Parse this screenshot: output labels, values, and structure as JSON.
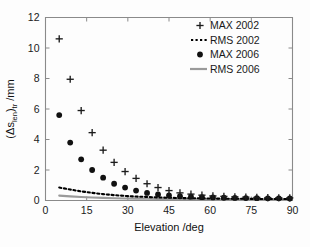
{
  "chart_data": {
    "type": "scatter",
    "title": "",
    "xlabel": "Elevation /deg",
    "ylabel": "(Δs_len)_tr /mm",
    "ylabel_parts": {
      "prefix": "(Δs",
      "sub1": "len",
      "mid": ")",
      "sub2": "tr",
      "suffix": " /mm"
    },
    "xlim": [
      0,
      90
    ],
    "ylim": [
      0,
      12
    ],
    "xticks": [
      0,
      15,
      30,
      45,
      60,
      75,
      90
    ],
    "yticks": [
      0,
      2,
      4,
      6,
      8,
      10,
      12
    ],
    "xtick_labels": [
      "0",
      "15",
      "30",
      "45",
      "60",
      "75",
      "90"
    ],
    "ytick_labels": [
      "0",
      "2",
      "4",
      "6",
      "8",
      "10",
      "12"
    ],
    "grid": false,
    "legend_position": "upper right",
    "x": [
      5,
      9,
      13,
      17,
      21,
      25,
      29,
      33,
      37,
      41,
      45,
      49,
      53,
      57,
      61,
      65,
      69,
      73,
      77,
      81,
      85,
      89
    ],
    "series": [
      {
        "name": "MAX 2002",
        "marker": "plus",
        "color": "#1c1c1c",
        "values": [
          10.6,
          7.95,
          5.9,
          4.45,
          3.3,
          2.5,
          1.9,
          1.45,
          1.1,
          0.85,
          0.65,
          0.5,
          0.42,
          0.35,
          0.3,
          0.27,
          0.24,
          0.22,
          0.2,
          0.19,
          0.18,
          0.17
        ]
      },
      {
        "name": "RMS 2002",
        "marker": "dashed-line",
        "color": "#000000",
        "values": [
          0.85,
          0.72,
          0.6,
          0.5,
          0.42,
          0.35,
          0.3,
          0.26,
          0.23,
          0.2,
          0.18,
          0.16,
          0.15,
          0.14,
          0.13,
          0.12,
          0.11,
          0.11,
          0.1,
          0.1,
          0.1,
          0.1
        ]
      },
      {
        "name": "MAX 2006",
        "marker": "circle",
        "color": "#111111",
        "values": [
          5.6,
          3.8,
          2.7,
          2.0,
          1.5,
          1.1,
          0.85,
          0.65,
          0.5,
          0.4,
          0.33,
          0.28,
          0.25,
          0.22,
          0.2,
          0.18,
          0.17,
          0.16,
          0.15,
          0.14,
          0.14,
          0.13
        ]
      },
      {
        "name": "RMS 2006",
        "marker": "solid-line",
        "color": "#9a9a9a",
        "values": [
          0.32,
          0.27,
          0.23,
          0.2,
          0.17,
          0.15,
          0.13,
          0.12,
          0.11,
          0.1,
          0.09,
          0.09,
          0.08,
          0.08,
          0.07,
          0.07,
          0.07,
          0.06,
          0.06,
          0.06,
          0.06,
          0.05
        ]
      }
    ]
  },
  "legend": {
    "items": [
      {
        "label": "MAX 2002",
        "marker": "plus"
      },
      {
        "label": "RMS 2002",
        "marker": "dashed-line"
      },
      {
        "label": "MAX 2006",
        "marker": "circle"
      },
      {
        "label": "RMS 2006",
        "marker": "solid-line"
      }
    ]
  },
  "colors": {
    "axis": "#8a8a8a",
    "text": "#1a1a1a",
    "max2002": "#1c1c1c",
    "rms2002": "#000000",
    "max2006": "#111111",
    "rms2006": "#9a9a9a",
    "background": "#ffffff"
  }
}
